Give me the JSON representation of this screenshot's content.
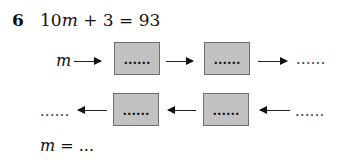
{
  "question": {
    "number": "6",
    "equation": {
      "coef": "10",
      "var": "m",
      "rest": " + 3 = 93"
    }
  },
  "forward_row": {
    "input_label": "m",
    "boxes": [
      "......",
      "......"
    ],
    "output": "......"
  },
  "inverse_row": {
    "input": "......",
    "boxes": [
      "......",
      "......"
    ],
    "output": "......"
  },
  "answer": {
    "var": "m",
    "rest": " = ..."
  },
  "colors": {
    "box_fill": "#c2c2c2",
    "box_border": "#6e6e6e"
  }
}
